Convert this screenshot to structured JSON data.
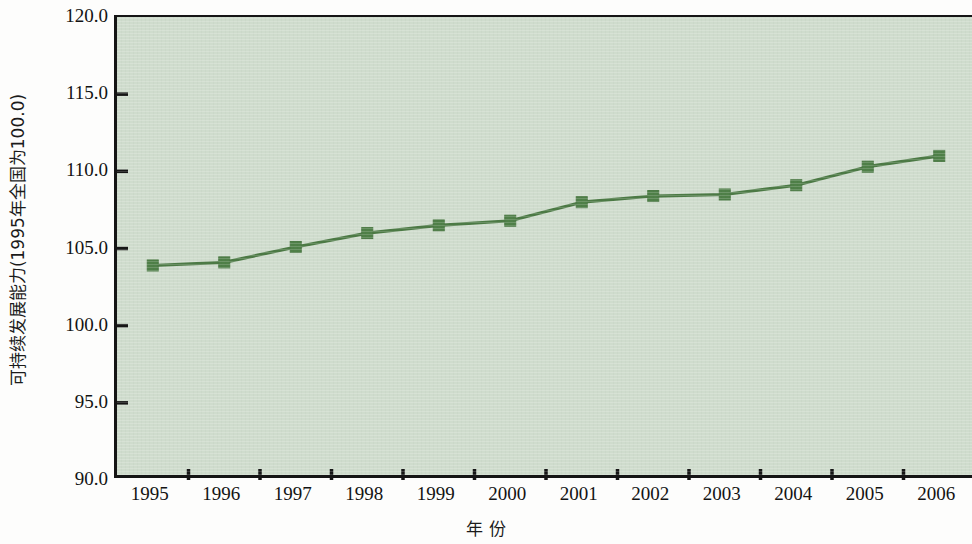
{
  "chart_data": {
    "type": "line",
    "title": "",
    "xlabel": "年  份",
    "ylabel": "可持续发展能力(1995年全国为100.0)",
    "categories": [
      "1995",
      "1996",
      "1997",
      "1998",
      "1999",
      "2000",
      "2001",
      "2002",
      "2003",
      "2004",
      "2005",
      "2006"
    ],
    "values": [
      103.9,
      104.1,
      105.1,
      106.0,
      106.5,
      106.8,
      108.0,
      108.4,
      108.5,
      109.1,
      110.3,
      111.0
    ],
    "series": [
      {
        "name": "可持续发展能力",
        "values": [
          103.9,
          104.1,
          105.1,
          106.0,
          106.5,
          106.8,
          108.0,
          108.4,
          108.5,
          109.1,
          110.3,
          111.0
        ]
      }
    ],
    "ylim": [
      90.0,
      120.0
    ],
    "y_ticks": [
      "120.0",
      "115.0",
      "110.0",
      "105.0",
      "100.0",
      "95.0",
      "90.0"
    ],
    "y_tick_values": [
      120.0,
      115.0,
      110.0,
      105.0,
      100.0,
      95.0,
      90.0
    ],
    "grid": false,
    "legend": "none",
    "marker": "square",
    "colors": {
      "line": "#4c7a45",
      "marker": "#4f8048",
      "plot_background": "#cfdccd",
      "axis": "#151515",
      "text": "#131313"
    }
  }
}
